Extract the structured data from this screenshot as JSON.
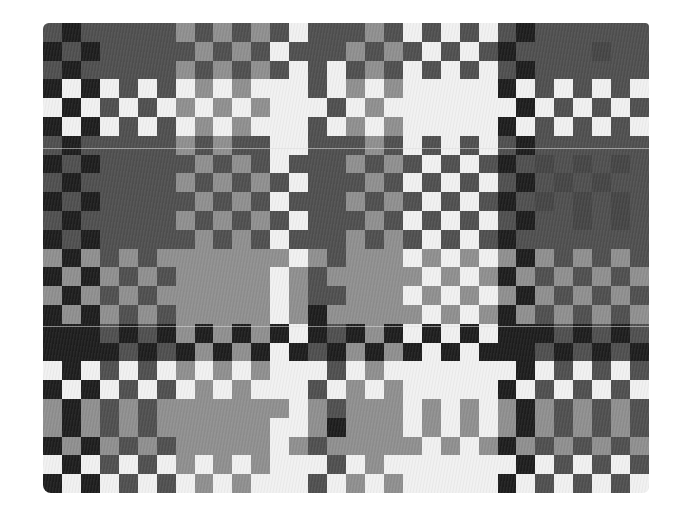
{
  "image": {
    "subject": "woven textile with checkerboard pattern",
    "palette": {
      "W": "#efefef",
      "M": "#8f8f8f",
      "D": "#505050",
      "E": "#464646",
      "K": "#1f1f1f",
      "background": "#ffffff"
    },
    "grid": {
      "columns": 32,
      "rows": 25
    },
    "rows": [
      "DKDDDDDMDMDMDWDDDMDWDWDWDKDDDDDD",
      "KDKDDDDDMDMDWDDDMDMDWDWDKDDDDEDD",
      "DKDDDDDMDMDMDWDWDMDWDWDWDKDDDDDD",
      "KWKWDWDWMWMWWWDWMWMWWWWWKWDWDWDW",
      "WKWDWDWMWMWMWWWDWMWWWWWWWKWDWDWD",
      "KWKWDWDWMWMWWWDWMWMWWWWWKWDWDWDW",
      "DKDDDDDMDMDDWWDDDMDWDWDWDKDDDDDD",
      "KDKDDDDDMDMDWDDDMDMDWDWDKDEDEDED",
      "DKDDDDDMDMDMDWDDDMDWDWDWDKDEDEDD",
      "KDKDDDDDMDMDWDDDMDMDWDWDKDEDEDED",
      "DKDDDDDMDMDMDWDDDMDWDWDWDKDDEDED",
      "KDKDDDDDMDMDWDDDMDMDWDWDKDDDDDDD",
      "MKMDMDMMMMMMMWMDMMMWMWMWMKMDMDMD",
      "KMKMDMDMMMMMWMDMMMMMWMWMKMDMDMDM",
      "MKMDMDMMMMMMWMDDMMMWMWMWMKMDMDMD",
      "KMKMDMDMMMMMWMKMMMMMWMWMKMDMDMDM",
      "KKKDKDKMKMKMKWKDKMKWKWKWKKKDKDKD",
      "KKKKDKDKMKMKWKDKMKMKWKWKKKDKDKDK",
      "WKWDWDWMWMWMWWWDWMWWWWWWWKWDWDWD",
      "KWKWDWDWMWMWWWDWMWMWWWWWKWDWDWDW",
      "MKMDMDMMMMMMMWMDMMMWMWMWMKMDMDMD",
      "MKMDMDMMMMMMWWMKMMMWMWMWMKMDMDMD",
      "KMKMDMDMMMMMWMDMMMMMWMWMKMDMDMDM",
      "WKWDWDWMWMWMWWWDWMWWWWWWWKWDWDWD",
      "KWKWDWDWMWMWWWDWMWMWWWWWKWDWDWDW"
    ],
    "seams": [
      {
        "x": 43,
        "y": 148,
        "width": 606
      },
      {
        "x": 43,
        "y": 326,
        "width": 606
      }
    ]
  }
}
